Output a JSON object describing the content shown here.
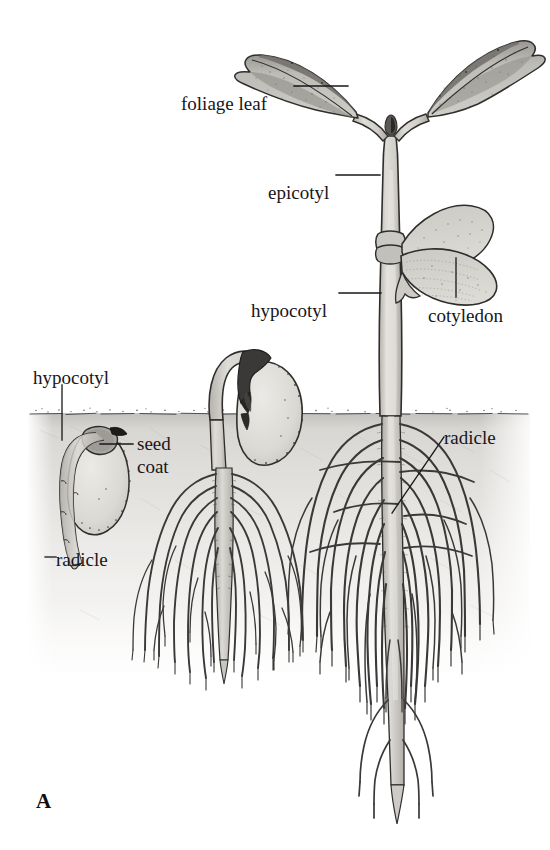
{
  "figure": {
    "panel_letter": "A",
    "background_color": "#ffffff",
    "ink_color": "#17161a",
    "soil_color": "#d5d3cf",
    "soil_surface_color": "#a9a7a3",
    "tissue_fill": "#d9d7d2",
    "leaf_fill": "#c6c4bf",
    "leaf_shade": "#8e8c88",
    "soil_line_y": 413
  },
  "labels": [
    {
      "id": "foliage-leaf",
      "text": "foliage leaf",
      "x": 181,
      "y": 93,
      "leader": "horizontal-right"
    },
    {
      "id": "epicotyl",
      "text": "epicotyl",
      "x": 268,
      "y": 182,
      "leader": "horizontal-right"
    },
    {
      "id": "hypocotyl-main",
      "text": "hypocotyl",
      "x": 251,
      "y": 300,
      "leader": "horizontal-right"
    },
    {
      "id": "cotyledon",
      "text": "cotyledon",
      "x": 428,
      "y": 305,
      "leader": "vertical-up"
    },
    {
      "id": "hypocotyl-seed",
      "text": "hypocotyl",
      "x": 33,
      "y": 367,
      "leader": "vertical-down"
    },
    {
      "id": "seed-coat",
      "text": "seed\ncoat",
      "x": 137,
      "y": 432,
      "leader": "horizontal-left"
    },
    {
      "id": "radicle-left",
      "text": "radicle",
      "x": 56,
      "y": 549,
      "leader": "short-left-tick"
    },
    {
      "id": "radicle-right",
      "text": "radicle",
      "x": 444,
      "y": 427,
      "leader": "diagonal-down-left"
    }
  ],
  "stages": [
    {
      "id": "stage-1-germinating-seed",
      "label": "germinating seed with emerging radicle"
    },
    {
      "id": "stage-2-hypocotyl-hook",
      "label": "seedling with hypocotyl hook and seed coat"
    },
    {
      "id": "stage-3-young-seedling",
      "label": "young seedling with foliage leaves and cotyledons"
    }
  ]
}
